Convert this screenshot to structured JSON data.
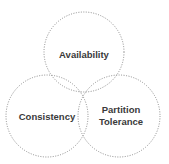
{
  "diagram": {
    "type": "venn",
    "circles": [
      {
        "id": "availability",
        "label": "Availability",
        "cx": 84,
        "cy": 52,
        "r": 40
      },
      {
        "id": "consistency",
        "label": "Consistency",
        "cx": 47,
        "cy": 116,
        "r": 41
      },
      {
        "id": "partition",
        "label_line1": "Partition",
        "label_line2": "Tolerance",
        "cx": 119,
        "cy": 116,
        "r": 41
      }
    ],
    "stroke_color": "#8a8a8a",
    "text_color": "#3a3a3a"
  }
}
